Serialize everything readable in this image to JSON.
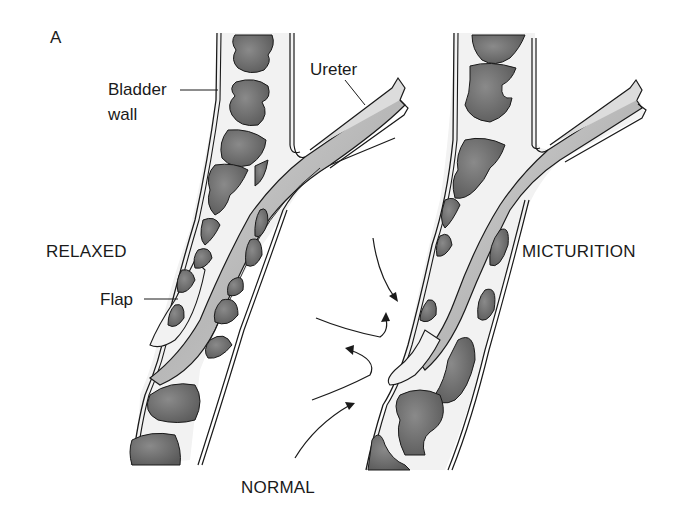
{
  "figure": {
    "panel_letter": "A",
    "labels": {
      "bladder_wall_line1": "Bladder",
      "bladder_wall_line2": "wall",
      "ureter": "Ureter",
      "flap": "Flap",
      "relaxed": "RELAXED",
      "micturition": "MICTURITION",
      "normal": "NORMAL"
    },
    "colors": {
      "outline": "#1a1a1a",
      "muscle_bundle": "#6e6e6e",
      "wall_fill": "#f2f2f2",
      "ureter_lumen": "#c4c4c4",
      "background": "#ffffff"
    },
    "panels": [
      {
        "name": "relaxed",
        "title": "RELAXED"
      },
      {
        "name": "micturition",
        "title": "MICTURITION"
      }
    ]
  }
}
